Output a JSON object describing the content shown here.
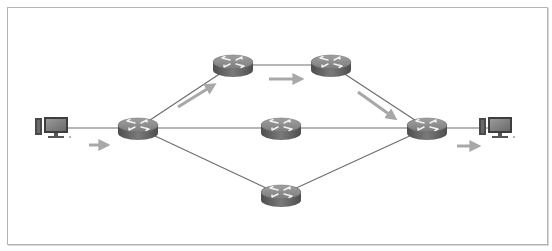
{
  "diagram": {
    "type": "network-topology",
    "colors": {
      "link": "#6e6e6e",
      "arrow": "#a8a8a8",
      "router_top": "#8c8c8c",
      "router_side": "#5e5e5e",
      "frame": "#b4b4b4"
    },
    "nodes": [
      {
        "id": "pc-source",
        "icon": "desktop-computer-icon",
        "x": 58,
        "y": 128
      },
      {
        "id": "router-ingress",
        "icon": "router-icon",
        "x": 138,
        "y": 128
      },
      {
        "id": "router-top-1",
        "icon": "router-icon",
        "x": 233,
        "y": 65
      },
      {
        "id": "router-top-2",
        "icon": "router-icon",
        "x": 331,
        "y": 65
      },
      {
        "id": "router-middle",
        "icon": "router-icon",
        "x": 281,
        "y": 128
      },
      {
        "id": "router-bottom",
        "icon": "router-icon",
        "x": 281,
        "y": 195
      },
      {
        "id": "router-egress",
        "icon": "router-icon",
        "x": 427,
        "y": 128
      },
      {
        "id": "pc-destination",
        "icon": "desktop-computer-icon",
        "x": 502,
        "y": 128
      }
    ],
    "links": [
      [
        "pc-source",
        "router-ingress"
      ],
      [
        "router-ingress",
        "router-top-1"
      ],
      [
        "router-top-1",
        "router-top-2"
      ],
      [
        "router-top-2",
        "router-egress"
      ],
      [
        "router-ingress",
        "router-middle"
      ],
      [
        "router-middle",
        "router-egress"
      ],
      [
        "router-ingress",
        "router-bottom"
      ],
      [
        "router-bottom",
        "router-egress"
      ],
      [
        "router-egress",
        "pc-destination"
      ]
    ],
    "flow_arrows": [
      {
        "from": [
          89,
          145
        ],
        "to": [
          105,
          145
        ]
      },
      {
        "from": [
          178,
          107
        ],
        "to": [
          212,
          86
        ]
      },
      {
        "from": [
          269,
          79
        ],
        "to": [
          299,
          79
        ]
      },
      {
        "from": [
          358,
          92
        ],
        "to": [
          393,
          117
        ]
      },
      {
        "from": [
          457,
          146
        ],
        "to": [
          476,
          146
        ]
      }
    ]
  }
}
